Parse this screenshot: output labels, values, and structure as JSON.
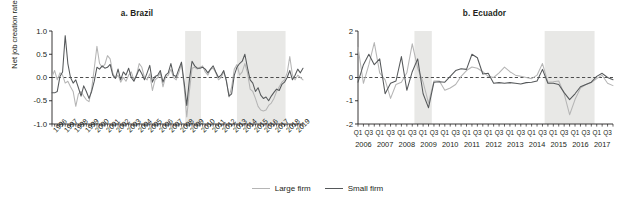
{
  "figure": {
    "legend": [
      {
        "key": "large",
        "label": "Large firm",
        "color": "#b5b5b5"
      },
      {
        "key": "small",
        "label": "Small firm",
        "color": "#55585a"
      }
    ],
    "shade_color": "#e8e8e6",
    "zero_line_color": "#4d4d4d"
  },
  "chart_data": [
    {
      "type": "line",
      "panel_id": "a",
      "title": "a. Brazil",
      "xlabel": "",
      "ylabel": "Net job creation rate",
      "ylim": [
        -1.0,
        1.0
      ],
      "yticks": [
        "1.0",
        "0.5",
        "0.0",
        "-0.5",
        "-1.0"
      ],
      "ytick_values": [
        1.0,
        0.5,
        0.0,
        -0.5,
        -1.0
      ],
      "grid": false,
      "zero_reference_line": 0.0,
      "legend_position": "bottom-center",
      "x_tick_labels": [
        "1996",
        "1997",
        "1998",
        "1999",
        "2000",
        "2001",
        "2002",
        "2003",
        "2004",
        "2005",
        "2006",
        "2007",
        "2008",
        "2009",
        "2010",
        "2011",
        "2012",
        "2013",
        "2014",
        "2015",
        "2016",
        "2017",
        "2018",
        "2019"
      ],
      "x_start_year": 1996,
      "points_per_year": 4,
      "shaded_regions": [
        {
          "x0": 2008.6,
          "x1": 2010.1,
          "label": "recession"
        },
        {
          "x0": 2013.5,
          "x1": 2018.1,
          "label": "recession"
        }
      ],
      "series": [
        {
          "name": "Large firm",
          "color": "#b5b5b5",
          "values": [
            0.02,
            0.15,
            -0.05,
            0.1,
            0.05,
            -0.12,
            -0.08,
            -0.2,
            -0.3,
            -0.62,
            -0.35,
            -0.3,
            -0.4,
            -0.48,
            -0.52,
            -0.25,
            0.2,
            0.67,
            0.3,
            0.22,
            0.28,
            0.47,
            0.4,
            0.1,
            -0.02,
            0.05,
            -0.1,
            0.0,
            -0.08,
            0.05,
            0.12,
            -0.05,
            0.05,
            0.3,
            0.22,
            0.0,
            -0.05,
            0.08,
            -0.28,
            -0.05,
            0.0,
            0.1,
            -0.2,
            0.02,
            0.05,
            0.18,
            0.0,
            -0.05,
            0.1,
            0.3,
            -0.2,
            -0.85,
            -0.3,
            0.2,
            0.22,
            0.18,
            0.22,
            0.25,
            0.12,
            0.05,
            0.18,
            0.2,
            0.1,
            -0.05,
            0.0,
            0.12,
            -0.05,
            -0.42,
            -0.2,
            0.18,
            0.28,
            0.05,
            0.12,
            0.3,
            0.1,
            -0.25,
            -0.3,
            -0.45,
            -0.62,
            -0.7,
            -0.72,
            -0.7,
            -0.6,
            -0.55,
            -0.45,
            -0.3,
            -0.2,
            -0.1,
            -0.05,
            0.1,
            0.45,
            0.05,
            -0.05,
            0.05,
            0.0,
            -0.05
          ]
        },
        {
          "name": "Small firm",
          "color": "#55585a",
          "values": [
            -0.33,
            -0.33,
            -0.3,
            0.02,
            0.12,
            0.9,
            0.3,
            0.0,
            -0.12,
            -0.05,
            -0.22,
            -0.4,
            -0.18,
            -0.3,
            -0.45,
            -0.3,
            -0.08,
            0.22,
            0.18,
            0.25,
            0.2,
            0.22,
            0.28,
            0.05,
            -0.02,
            0.18,
            -0.05,
            0.12,
            0.05,
            0.2,
            0.0,
            -0.08,
            0.05,
            0.18,
            0.08,
            -0.05,
            0.1,
            0.26,
            -0.1,
            0.02,
            0.05,
            0.15,
            -0.1,
            0.05,
            0.1,
            0.3,
            0.05,
            0.02,
            0.18,
            0.33,
            -0.1,
            -0.6,
            -0.05,
            0.35,
            0.25,
            0.2,
            0.2,
            0.22,
            0.18,
            0.1,
            0.18,
            0.25,
            0.12,
            0.0,
            0.05,
            0.15,
            -0.08,
            -0.4,
            -0.35,
            0.05,
            0.22,
            0.3,
            0.35,
            0.5,
            0.2,
            -0.05,
            -0.12,
            -0.3,
            -0.22,
            -0.38,
            -0.45,
            -0.42,
            -0.5,
            -0.4,
            -0.32,
            -0.25,
            -0.28,
            -0.15,
            -0.1,
            0.0,
            0.15,
            -0.05,
            0.05,
            0.18,
            0.1,
            0.2
          ]
        }
      ]
    },
    {
      "type": "line",
      "panel_id": "b",
      "title": "b. Ecuador",
      "xlabel": "",
      "ylabel": "",
      "ylim": [
        -2,
        2
      ],
      "yticks": [
        "2",
        "1",
        "0",
        "-1",
        "-2"
      ],
      "ytick_values": [
        2,
        1,
        0,
        -1,
        -2
      ],
      "grid": false,
      "zero_reference_line": 0,
      "legend_position": "bottom-center",
      "x_quarter_labels": [
        "Q1",
        "Q3",
        "Q1",
        "Q3",
        "Q1",
        "Q3",
        "Q1",
        "Q3",
        "Q1",
        "Q3",
        "Q1",
        "Q3",
        "Q1",
        "Q3",
        "Q1",
        "Q3",
        "Q1",
        "Q3",
        "Q1",
        "Q3",
        "Q1",
        "Q3",
        "Q1",
        "Q3"
      ],
      "x_year_labels": [
        "2006",
        "2007",
        "2008",
        "2009",
        "2010",
        "2011",
        "2012",
        "2013",
        "2014",
        "2015",
        "2016",
        "2017"
      ],
      "x_start_year": 2006,
      "points_per_year": 4,
      "shaded_regions": [
        {
          "x0": 2008.6,
          "x1": 2009.4,
          "label": "recession"
        },
        {
          "x0": 2014.6,
          "x1": 2016.9,
          "label": "recession"
        }
      ],
      "series": [
        {
          "name": "Large firm",
          "color": "#b5b5b5",
          "values": [
            1.3,
            -0.25,
            0.55,
            1.5,
            0.2,
            -0.1,
            -0.9,
            -0.3,
            -0.2,
            0.2,
            1.45,
            0.4,
            -0.2,
            -1.1,
            -0.15,
            -0.15,
            -0.55,
            -0.45,
            -0.3,
            0.05,
            0.3,
            0.45,
            0.4,
            0.25,
            0.05,
            0.0,
            0.2,
            0.45,
            0.25,
            0.1,
            0.05,
            0.0,
            -0.05,
            0.1,
            0.6,
            -0.2,
            -0.18,
            -0.15,
            -0.7,
            -1.6,
            -0.95,
            -0.45,
            -0.3,
            -0.22,
            -0.05,
            0.1,
            -0.25,
            -0.35
          ]
        },
        {
          "name": "Small firm",
          "color": "#55585a",
          "values": [
            -0.2,
            0.55,
            1.0,
            0.55,
            0.8,
            -0.7,
            -0.25,
            -0.15,
            0.9,
            -0.55,
            0.25,
            0.8,
            -0.7,
            -1.3,
            -0.2,
            -0.18,
            -0.2,
            0.05,
            0.3,
            0.38,
            0.35,
            1.0,
            0.85,
            0.15,
            0.18,
            -0.25,
            -0.22,
            -0.25,
            -0.22,
            -0.25,
            -0.28,
            -0.22,
            -0.2,
            -0.15,
            0.35,
            -0.25,
            -0.25,
            -0.3,
            -0.65,
            -0.95,
            -0.7,
            -0.4,
            -0.3,
            -0.2,
            0.05,
            0.18,
            0.0,
            -0.1
          ]
        }
      ]
    }
  ]
}
